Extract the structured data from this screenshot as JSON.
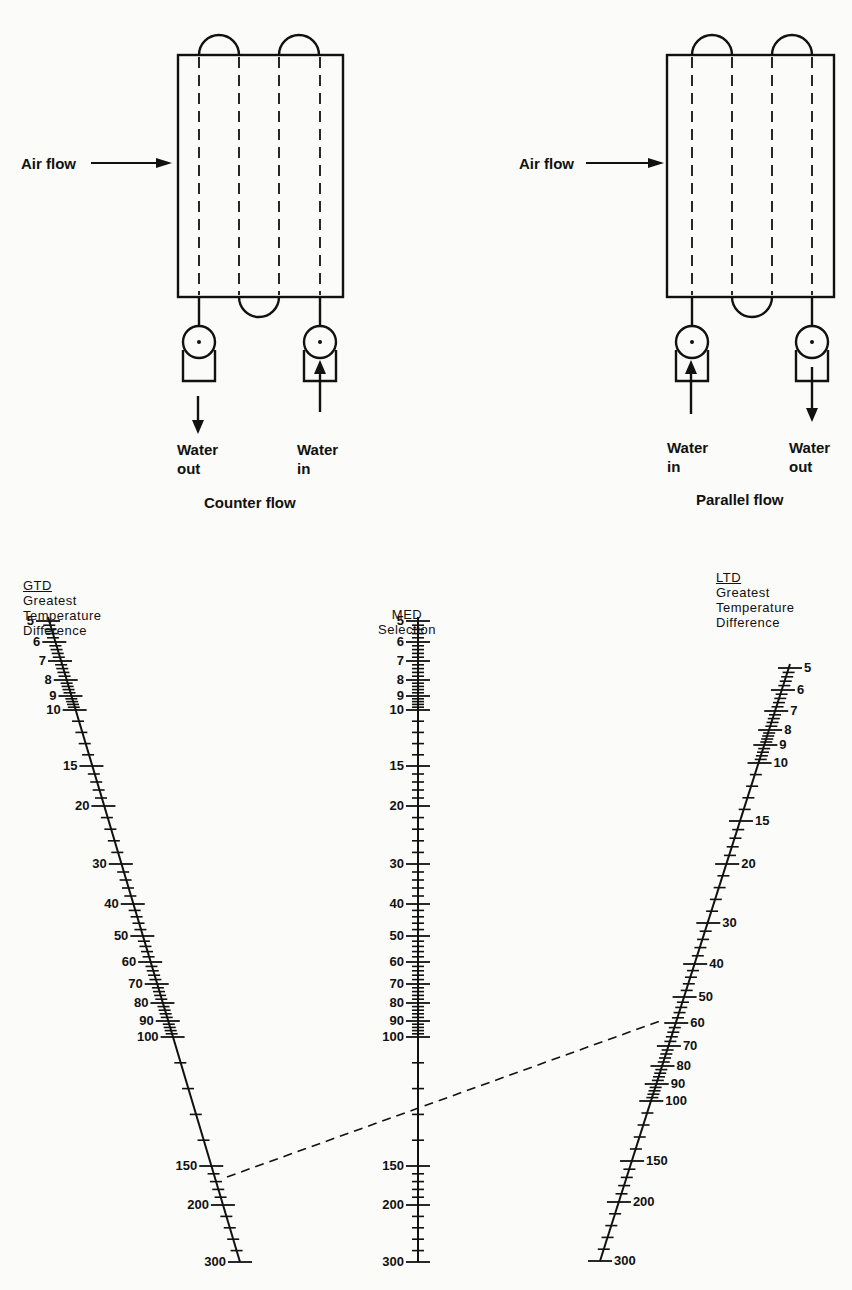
{
  "diagrams": {
    "counter_flow": {
      "caption": "Counter flow",
      "air_label": "Air flow",
      "left_water": {
        "line1": "Water",
        "line2": "out"
      },
      "right_water": {
        "line1": "Water",
        "line2": "in"
      }
    },
    "parallel_flow": {
      "caption": "Parallel flow",
      "air_label": "Air flow",
      "left_water": {
        "line1": "Water",
        "line2": "in"
      },
      "right_water": {
        "line1": "Water",
        "line2": "out"
      }
    }
  },
  "nomograph": {
    "gtd": {
      "abbr": "GTD",
      "line1": "Greatest",
      "line2": "Temperature",
      "line3": "Difference"
    },
    "med": {
      "line1": "MED",
      "line2": "Selection"
    },
    "ltd": {
      "abbr": "LTD",
      "line1": "Greatest",
      "line2": "Temperature",
      "line3": "Difference"
    },
    "scale_labels": [
      "5",
      "6",
      "7",
      "8",
      "9",
      "10",
      "15",
      "20",
      "30",
      "40",
      "50",
      "60",
      "70",
      "80",
      "90",
      "100",
      "150",
      "200",
      "300"
    ],
    "example_line": {
      "gtd_value": 170,
      "med_value": 100,
      "ltd_value": 58
    }
  }
}
